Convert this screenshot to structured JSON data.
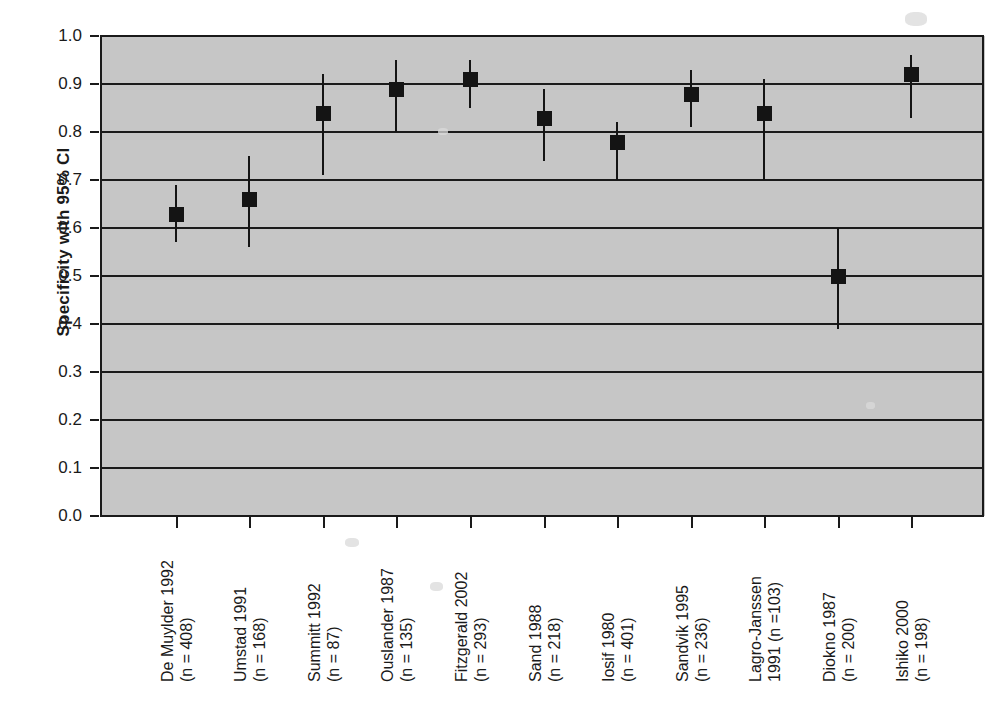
{
  "chart_data": {
    "type": "scatter",
    "title": "",
    "subtitle": "",
    "xlabel": "",
    "ylabel": "Specificity with 95% CI",
    "ylim": [
      0.0,
      1.0
    ],
    "ytick_labels": [
      "0.0",
      "0.1",
      "0.2",
      "0.3",
      "0.4",
      "0.5",
      "0.6",
      "0.7",
      "0.8",
      "0.9",
      "1.0"
    ],
    "ytick_values": [
      0.0,
      0.1,
      0.2,
      0.3,
      0.4,
      0.5,
      0.6,
      0.7,
      0.8,
      0.9,
      1.0
    ],
    "gridlines_at": [
      0.1,
      0.2,
      0.3,
      0.4,
      0.5,
      0.6,
      0.7,
      0.8,
      0.9
    ],
    "grid": true,
    "legend": "none",
    "plot_background": "#c6c6c6",
    "marker_color": "#141414",
    "marker_shape": "square",
    "categories": [
      "De Muylder 1992 (n = 408)",
      "Umstad 1991 (n = 168)",
      "Summitt 1992 (n = 87)",
      "Ouslander 1987 (n = 135)",
      "Fitzgerald 2002 (n = 293)",
      "Sand 1988 (n = 218)",
      "Iosif 1980 (n = 401)",
      "Sandvik 1995 (n = 236)",
      "Lagro-Janssen 1991 (n =103)",
      "Diokno 1987 (n = 200)",
      "Ishiko 2000 (n = 198)"
    ],
    "points": [
      {
        "label_line1": "De Muylder 1992",
        "label_line2": "(n = 408)",
        "study": "De Muylder",
        "year": 1992,
        "n": 408,
        "value": 0.63,
        "ci_low": 0.57,
        "ci_high": 0.69
      },
      {
        "label_line1": "Umstad 1991",
        "label_line2": "(n = 168)",
        "study": "Umstad",
        "year": 1991,
        "n": 168,
        "value": 0.66,
        "ci_low": 0.56,
        "ci_high": 0.75
      },
      {
        "label_line1": "Summitt 1992",
        "label_line2": "(n = 87)",
        "study": "Summitt",
        "year": 1992,
        "n": 87,
        "value": 0.84,
        "ci_low": 0.71,
        "ci_high": 0.92
      },
      {
        "label_line1": "Ouslander 1987",
        "label_line2": "(n = 135)",
        "study": "Ouslander",
        "year": 1987,
        "n": 135,
        "value": 0.89,
        "ci_low": 0.8,
        "ci_high": 0.95
      },
      {
        "label_line1": "Fitzgerald 2002",
        "label_line2": "(n = 293)",
        "study": "Fitzgerald",
        "year": 2002,
        "n": 293,
        "value": 0.91,
        "ci_low": 0.85,
        "ci_high": 0.95
      },
      {
        "label_line1": "Sand 1988",
        "label_line2": "(n = 218)",
        "study": "Sand",
        "year": 1988,
        "n": 218,
        "value": 0.83,
        "ci_low": 0.74,
        "ci_high": 0.89
      },
      {
        "label_line1": "Iosif 1980",
        "label_line2": "(n = 401)",
        "study": "Iosif",
        "year": 1980,
        "n": 401,
        "value": 0.78,
        "ci_low": 0.7,
        "ci_high": 0.82
      },
      {
        "label_line1": "Sandvik 1995",
        "label_line2": "(n = 236)",
        "study": "Sandvik",
        "year": 1995,
        "n": 236,
        "value": 0.88,
        "ci_low": 0.81,
        "ci_high": 0.93
      },
      {
        "label_line1": "Lagro-Janssen",
        "label_line2": "1991 (n =103)",
        "study": "Lagro-Janssen",
        "year": 1991,
        "n": 103,
        "value": 0.84,
        "ci_low": 0.7,
        "ci_high": 0.91
      },
      {
        "label_line1": "Diokno 1987",
        "label_line2": "(n = 200)",
        "study": "Diokno",
        "year": 1987,
        "n": 200,
        "value": 0.5,
        "ci_low": 0.39,
        "ci_high": 0.6
      },
      {
        "label_line1": "Ishiko 2000",
        "label_line2": "(n = 198)",
        "study": "Ishiko",
        "year": 2000,
        "n": 198,
        "value": 0.92,
        "ci_low": 0.83,
        "ci_high": 0.96
      }
    ]
  }
}
